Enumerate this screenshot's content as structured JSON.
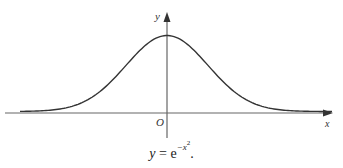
{
  "figure": {
    "type": "function-plot",
    "axes": {
      "x_label": "x",
      "y_label": "y",
      "origin_label": "O"
    },
    "curve": {
      "function": "y = e^(-x^2)",
      "shape": "bell curve"
    },
    "caption": {
      "lhs": "y",
      "equals": "=",
      "base": "e",
      "exponent": "−x",
      "exponent_power": "2",
      "trailing": "."
    },
    "colors": {
      "axis": "#555555",
      "curve": "#333333",
      "text": "#222222"
    }
  }
}
